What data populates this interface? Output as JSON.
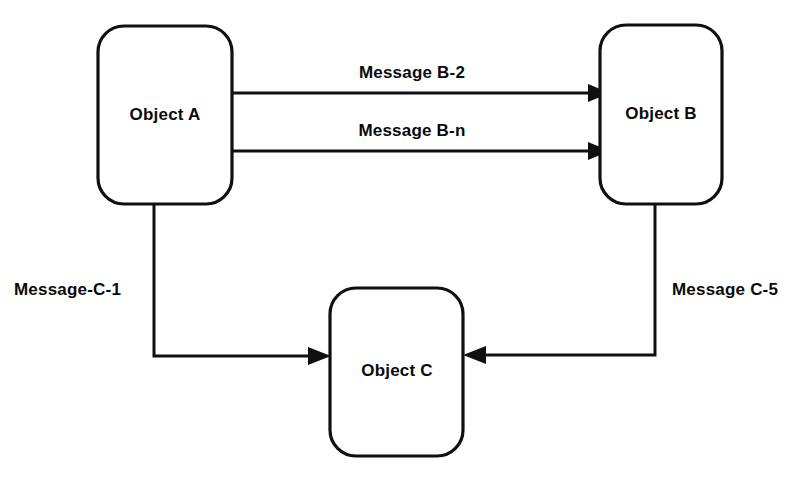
{
  "diagram": {
    "background_color": "#ffffff",
    "stroke_color": "#101010",
    "text_color": "#0a0a0a",
    "nodes": [
      {
        "id": "object-a",
        "label": "Object A",
        "shape": "rounded-rectangle",
        "x": 98,
        "y": 26,
        "width": 134,
        "height": 178,
        "corner_radius": 26,
        "label_x": 165,
        "label_y": 116
      },
      {
        "id": "object-b",
        "label": "Object B",
        "shape": "rounded-rectangle",
        "x": 600,
        "y": 25,
        "width": 122,
        "height": 179,
        "corner_radius": 26,
        "label_x": 661,
        "label_y": 115
      },
      {
        "id": "object-c",
        "label": "Object C",
        "shape": "rounded-rectangle",
        "x": 330,
        "y": 288,
        "width": 133,
        "height": 168,
        "corner_radius": 26,
        "label_x": 397,
        "label_y": 372
      }
    ],
    "edges": [
      {
        "id": "edge-message-b-2",
        "label": "Message B-2",
        "from": "object-a",
        "to": "object-b",
        "direction": "left-to-right",
        "path": "M 232 93 L 588 93",
        "arrow_points": "588,84 588,102 610,93",
        "label_x": 412,
        "label_y": 78,
        "label_anchor": "middle"
      },
      {
        "id": "edge-message-b-n",
        "label": "Message B-n",
        "from": "object-a",
        "to": "object-b",
        "direction": "left-to-right",
        "path": "M 232 151 L 588 151",
        "arrow_points": "588,142 588,160 610,151",
        "label_x": 412,
        "label_y": 136,
        "label_anchor": "middle"
      },
      {
        "id": "edge-message-c-1",
        "label": "Message-C-1",
        "from": "object-a",
        "to": "object-c",
        "direction": "down-then-right",
        "path": "M 154 204 L 154 356 L 308 356",
        "arrow_points": "308,347 308,365 331,356",
        "label_x": 14,
        "label_y": 288,
        "label_anchor": "start"
      },
      {
        "id": "edge-message-c-5",
        "label": "Message C-5",
        "from": "object-b",
        "to": "object-c",
        "direction": "down-then-left",
        "path": "M 655 204 L 655 355 L 486 355",
        "arrow_points": "486,346 486,364 463,355",
        "label_x": 672,
        "label_y": 288,
        "label_anchor": "start"
      }
    ]
  }
}
